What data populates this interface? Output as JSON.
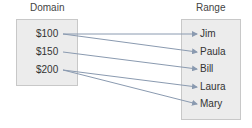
{
  "domain": {
    "title": "Domain",
    "items": [
      "$100",
      "$150",
      "$200"
    ]
  },
  "range": {
    "title": "Range",
    "items": [
      "Jim",
      "Paula",
      "Bill",
      "Laura",
      "Mary"
    ]
  },
  "mappings": [
    {
      "from": "$100",
      "to": "Jim"
    },
    {
      "from": "$100",
      "to": "Paula"
    },
    {
      "from": "$150",
      "to": "Bill"
    },
    {
      "from": "$200",
      "to": "Laura"
    },
    {
      "from": "$200",
      "to": "Mary"
    }
  ],
  "colors": {
    "box_fill": "#ececec",
    "box_border": "#c8c8c8",
    "arrow": "#8a9ab0"
  }
}
